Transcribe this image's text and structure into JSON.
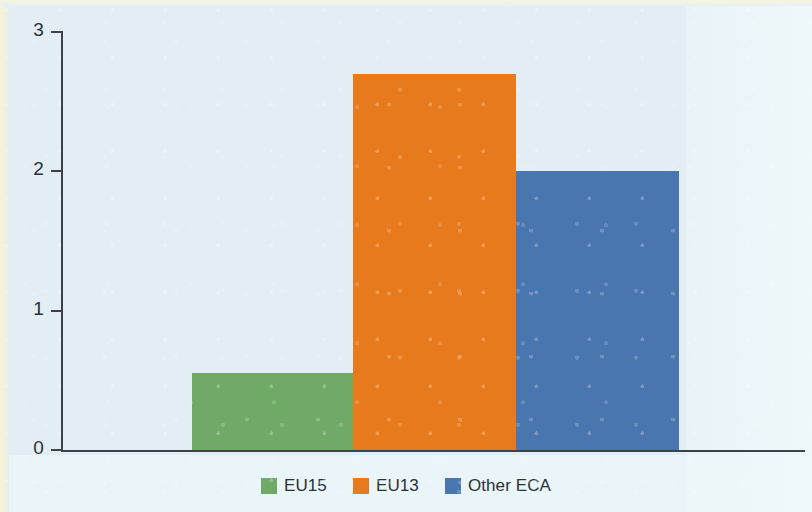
{
  "chart_data": {
    "type": "bar",
    "title": "",
    "subtitle": "",
    "xlabel": "",
    "ylabel": "",
    "categories": [
      "EU15",
      "EU13",
      "Other ECA"
    ],
    "values": [
      0.55,
      2.7,
      2.0
    ],
    "series": [
      {
        "name": "Shares",
        "values": [
          0.55,
          2.7,
          2.0
        ]
      }
    ],
    "colors": [
      "#6faa66",
      "#e87a1e",
      "#4a76b0"
    ],
    "ylim": [
      0,
      3
    ],
    "yticks": [
      0,
      1,
      2,
      3
    ],
    "ytick_labels": [
      "0",
      "1",
      "2",
      "3"
    ],
    "grid": false,
    "legend_position": "bottom",
    "bars_touching": true
  },
  "axis": {
    "y_ticks": [
      {
        "label": "3",
        "value": 3
      },
      {
        "label": "2",
        "value": 2
      },
      {
        "label": "1",
        "value": 1
      },
      {
        "label": "0",
        "value": 0
      }
    ]
  },
  "legend": {
    "items": [
      {
        "label": "EU15",
        "color": "#6faa66"
      },
      {
        "label": "EU13",
        "color": "#e87a1e"
      },
      {
        "label": "Other ECA",
        "color": "#4a76b0"
      }
    ]
  },
  "palette": {
    "background": "#e2eef3",
    "axis": "#3c4247",
    "text": "#2b3136",
    "green": "#6faa66",
    "orange": "#e87a1e",
    "blue": "#4a76b0"
  }
}
